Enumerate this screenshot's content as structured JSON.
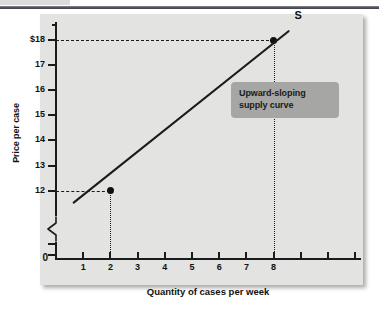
{
  "chart_data": {
    "type": "line",
    "title": "",
    "xlabel": "Quantity of cases per week",
    "ylabel": "Price per case",
    "xlim": [
      0,
      11
    ],
    "ylim": [
      11.4,
      18.6
    ],
    "grid": false,
    "legend": null,
    "axis_break": true,
    "origin_label": "0",
    "x_tick_labels": [
      "1",
      "2",
      "3",
      "4",
      "5",
      "6",
      "7",
      "8"
    ],
    "x_tick_values": [
      1,
      2,
      3,
      4,
      5,
      6,
      7,
      8
    ],
    "x_unlabeled_ticks": [
      9,
      10,
      11
    ],
    "y_tick_labels": [
      "$18",
      "17",
      "16",
      "15",
      "14",
      "13",
      "12"
    ],
    "y_tick_values": [
      18,
      17,
      16,
      15,
      14,
      13,
      12
    ],
    "series": [
      {
        "name": "S",
        "label": "S",
        "kind": "supply-curve",
        "x": [
          0.65,
          8.55
        ],
        "y": [
          11.52,
          18.35
        ],
        "points": [
          {
            "x": 2,
            "y": 12,
            "marked": true
          },
          {
            "x": 8,
            "y": 18,
            "marked": true
          }
        ]
      }
    ],
    "annotations": [
      {
        "name": "callout",
        "lines": [
          "Upward-sloping",
          "supply curve"
        ],
        "x": 8.0,
        "y": 15.6
      },
      {
        "name": "curve-label",
        "text": "S",
        "x": 8.9,
        "y": 18.6
      }
    ],
    "guides": [
      {
        "orientation": "horizontal",
        "value": 18,
        "from": 0,
        "to": 8,
        "style": "dashed"
      },
      {
        "orientation": "horizontal",
        "value": 12,
        "from": 0,
        "to": 2,
        "style": "dashed"
      },
      {
        "orientation": "vertical",
        "value": 8,
        "from": 0,
        "to": 18,
        "style": "dotted"
      },
      {
        "orientation": "vertical",
        "value": 2,
        "from": 0,
        "to": 12,
        "style": "dotted"
      }
    ]
  },
  "colors": {
    "panel_background": "#e3e3e1",
    "axis": "#1b1b1b",
    "curve": "#1b1b1b",
    "callout_background": "#a6a6a4",
    "text": "#111111",
    "page_background": "#ffffff",
    "top_rule": "#55585e"
  }
}
